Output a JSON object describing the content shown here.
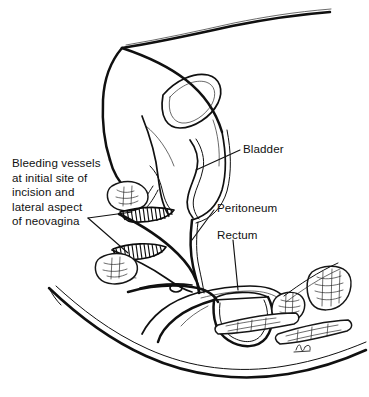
{
  "figure": {
    "title": "Bleeding vessels at initial site of incision and lateral aspect of neovagina",
    "type": "medical-line-illustration",
    "view": "midsagittal pelvic section",
    "background_color": "#ffffff",
    "ink_color": "#101010",
    "width": 369,
    "height": 397
  },
  "labels": {
    "bleeding": {
      "text": "Bleeding vessels\nat initial site of\nincision and\nlateral aspect\nof neovagina",
      "lines": [
        "Bleeding vessels",
        "at initial site of",
        "incision and",
        "lateral aspect",
        "of neovagina"
      ],
      "side": "left",
      "points_to": "hatched bleeding bands of neovagina canal"
    },
    "bladder": {
      "text": "Bladder",
      "side": "right",
      "points_to": "bladder lumen and wall"
    },
    "peritoneum": {
      "text": "Peritoneum",
      "side": "right",
      "points_to": "peritoneal reflection fold"
    },
    "rectum": {
      "text": "Rectum",
      "side": "right",
      "points_to": "rectal lumen"
    }
  },
  "structures": [
    {
      "name": "abdominal-wall",
      "label": "Anterior abdominal wall"
    },
    {
      "name": "bladder",
      "label": "Bladder"
    },
    {
      "name": "urethra",
      "label": "Urethra"
    },
    {
      "name": "pubic-symphysis",
      "label": "Pubic symphysis"
    },
    {
      "name": "neovagina-canal",
      "label": "Neovagina canal"
    },
    {
      "name": "bleeding-band-upper",
      "label": "Upper bleeding vessel band"
    },
    {
      "name": "bleeding-band-lower",
      "label": "Lower bleeding vessel band"
    },
    {
      "name": "peritoneum",
      "label": "Peritoneum"
    },
    {
      "name": "rectum",
      "label": "Rectum"
    },
    {
      "name": "sacrum",
      "label": "Sacral vertebrae"
    },
    {
      "name": "coccyx",
      "label": "Coccyx"
    },
    {
      "name": "buttock-contour",
      "label": "Buttock and thigh contour"
    }
  ],
  "artist_signature": {
    "present": true,
    "description": "small handwritten monogram near lower right"
  }
}
